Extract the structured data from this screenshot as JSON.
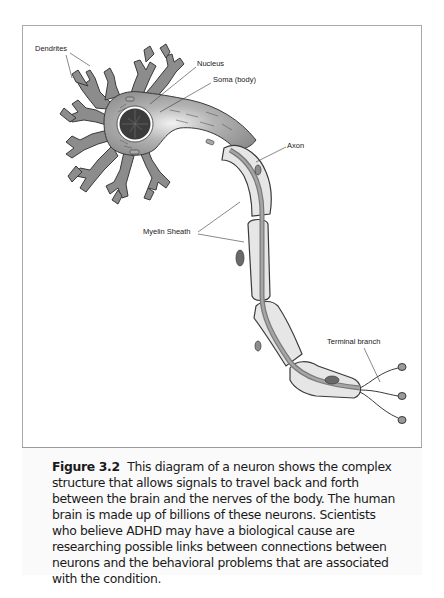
{
  "figure": {
    "labels": {
      "dendrites": "Dendrites",
      "nucleus": "Nucleus",
      "soma": "Soma (body)",
      "axon": "Axon",
      "myelin_sheath": "Myelin Sheath",
      "terminal_branch": "Terminal branch"
    },
    "caption": {
      "figure_number": "Figure 3.2",
      "text": "This diagram of a neuron shows the complex structure that allows signals to travel back and forth between the brain and the nerves of the body. The human brain is made up of billions of these neurons. Scientists who believe ADHD may have a biological cause are researching possible links between connections between neurons and the behavioral problems that are associated with the condition."
    },
    "colors": {
      "cell_fill": "#8c8c8c",
      "cell_outline": "#3a3a3a",
      "myelin_fill": "#e6e6e6",
      "nucleus_fill": "#3c3c3c",
      "border": "#a9a9a9"
    }
  }
}
